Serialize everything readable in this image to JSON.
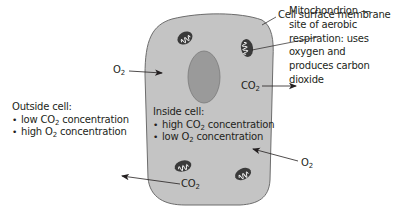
{
  "diagram": {
    "type": "gas-exchange-cell",
    "colors": {
      "cytoplasm": "#c4c4c4",
      "membrane": "#6d6d6d",
      "nucleus": "#9a9a9a",
      "mitochondrion": "#3a3a3a",
      "text": "#231f20"
    },
    "labels": {
      "membrane": "Cell surface membrane",
      "mitochondrion_lines": [
        "Mitochondrion —",
        "site of aerobic",
        "respiration: uses",
        "oxygen and",
        "produces carbon",
        "dioxide"
      ],
      "o2_in_top": {
        "base": "O",
        "sub": "2"
      },
      "co2_out_right": {
        "base": "CO",
        "sub": "2"
      },
      "co2_out_bottom": {
        "base": "CO",
        "sub": "2"
      },
      "o2_in_bottom": {
        "base": "O",
        "sub": "2"
      }
    },
    "outside": {
      "heading": "Outside cell:",
      "items": [
        {
          "pre": "low CO",
          "sub": "2",
          "post": " concentration"
        },
        {
          "pre": "high O",
          "sub": "2",
          "post": " concentration"
        }
      ]
    },
    "inside": {
      "heading": "Inside cell:",
      "items": [
        {
          "pre": "high CO",
          "sub": "2",
          "post": " concentration"
        },
        {
          "pre": "low O",
          "sub": "2",
          "post": " concentration"
        }
      ]
    }
  }
}
